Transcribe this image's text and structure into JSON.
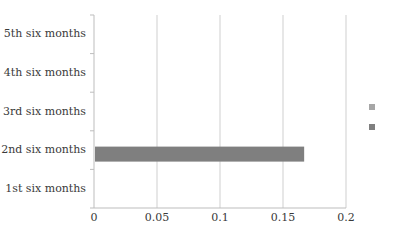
{
  "chart_data": {
    "type": "bar",
    "orientation": "horizontal",
    "title": "",
    "xlabel": "",
    "ylabel": "",
    "categories": [
      "1st six months",
      "2nd six months",
      "3rd six months",
      "4th six months",
      "5th six months"
    ],
    "series": [
      {
        "name": "",
        "color": "#a6a6a6",
        "values": [
          0,
          0,
          0,
          0,
          0
        ]
      },
      {
        "name": "",
        "color": "#7f7f7f",
        "values": [
          0,
          0.166,
          0,
          0,
          0
        ]
      }
    ],
    "xlim": [
      0,
      0.2
    ],
    "xticks": [
      "0",
      "0.05",
      "0.1",
      "0.15",
      "0.2"
    ],
    "xtick_values": [
      0,
      0.05,
      0.1,
      0.15,
      0.2
    ],
    "grid": {
      "vertical": true,
      "horizontal": false,
      "color": "#cfcfcf"
    },
    "legend": {
      "position": "right",
      "entries": [
        {
          "label": "",
          "color": "#a6a6a6"
        },
        {
          "label": "",
          "color": "#7f7f7f"
        }
      ]
    }
  }
}
